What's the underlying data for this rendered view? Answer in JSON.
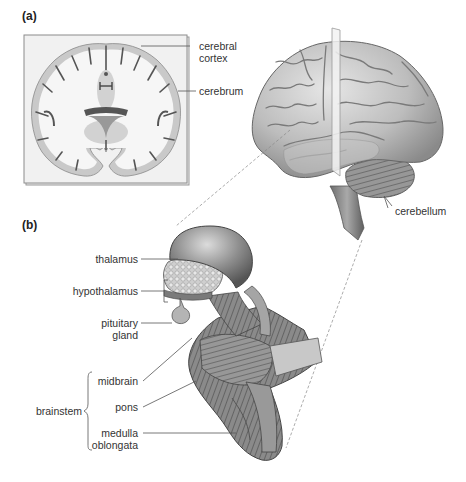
{
  "figure": {
    "panels": [
      {
        "id": "a",
        "label": "(a)",
        "description": "Coronal section of the brain and lateral view of the brain with cutting plane",
        "labels": {
          "cerebral_cortex_line1": "cerebral",
          "cerebral_cortex_line2": "cortex",
          "cerebrum": "cerebrum",
          "cerebellum": "cerebellum"
        }
      },
      {
        "id": "b",
        "label": "(b)",
        "description": "Enlarged view of thalamus, hypothalamus, pituitary gland and brainstem",
        "labels": {
          "thalamus": "thalamus",
          "hypothalamus": "hypothalamus",
          "pituitary_line1": "pituitary",
          "pituitary_line2": "gland",
          "brainstem": "brainstem",
          "midbrain": "midbrain",
          "pons": "pons",
          "medulla_line1": "medulla",
          "medulla_line2": "oblongata"
        }
      }
    ],
    "colors": {
      "background": "#ffffff",
      "section_box": "#eeeeee",
      "gray_matter": "#c8c8c8",
      "white_matter": "#f4f4f4",
      "leader_line": "#555555",
      "brain_fill": "#b8b8b8",
      "text": "#333333"
    }
  }
}
